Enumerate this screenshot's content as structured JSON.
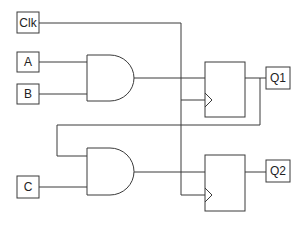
{
  "diagram": {
    "type": "sequential-logic-circuit",
    "colors": {
      "line": "#3a3a3a",
      "box_fill": "#ffffff",
      "text": "#222222",
      "background": "#ffffff"
    },
    "inputs": [
      {
        "id": "clk",
        "label": "Clk"
      },
      {
        "id": "a",
        "label": "A"
      },
      {
        "id": "b",
        "label": "B"
      },
      {
        "id": "c",
        "label": "C"
      }
    ],
    "outputs": [
      {
        "id": "q1",
        "label": "Q1"
      },
      {
        "id": "q2",
        "label": "Q2"
      }
    ],
    "gates": [
      {
        "id": "and1",
        "type": "AND",
        "inputs": [
          "A",
          "B"
        ]
      },
      {
        "id": "and2",
        "type": "AND",
        "inputs": [
          "Q1",
          "C"
        ]
      }
    ],
    "flip_flops": [
      {
        "id": "ff1",
        "type": "D",
        "d": "and1",
        "clock": "Clk",
        "q": "Q1"
      },
      {
        "id": "ff2",
        "type": "D",
        "d": "and2",
        "clock": "Clk",
        "q": "Q2"
      }
    ]
  }
}
